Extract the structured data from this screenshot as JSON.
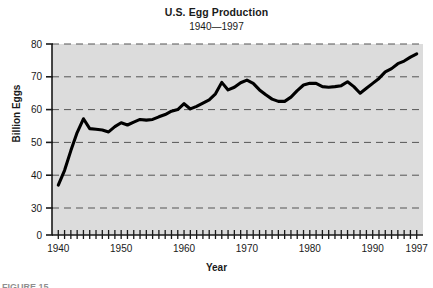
{
  "figure": {
    "title": "U.S. Egg Production",
    "subtitle": "1940—1997",
    "ylabel": "Billion Eggs",
    "xlabel": "Year",
    "caption_clipped": "FIGURE 15",
    "plot_bg_color": "#dcdcdc",
    "line_color": "#000000",
    "gridline_color": "#555555"
  },
  "chart_data": {
    "type": "line",
    "title": "U.S. Egg Production",
    "subtitle": "1940—1997",
    "xlabel": "Year",
    "ylabel": "Billion Eggs",
    "xlim": [
      1939,
      1998
    ],
    "ylim": [
      0,
      80
    ],
    "y_axis_broken": true,
    "y_axis_break_note": "axis jumps from 0 to 30",
    "grid": true,
    "grid_style": "dashed horizontal",
    "legend": null,
    "ytick_labels": [
      "0",
      "30",
      "40",
      "50",
      "60",
      "70",
      "80"
    ],
    "ytick_values": [
      0,
      30,
      40,
      50,
      60,
      70,
      80
    ],
    "xtick_labels": [
      "1940",
      "1950",
      "1960",
      "1970",
      "1980",
      "1990",
      "1997"
    ],
    "xtick_values": [
      1940,
      1950,
      1960,
      1970,
      1980,
      1990,
      1997
    ],
    "minor_xticks_every": 1,
    "series": [
      {
        "name": "U.S. Egg Production",
        "x": [
          1940,
          1941,
          1942,
          1943,
          1944,
          1945,
          1946,
          1947,
          1948,
          1949,
          1950,
          1951,
          1952,
          1953,
          1954,
          1955,
          1956,
          1957,
          1958,
          1959,
          1960,
          1961,
          1962,
          1963,
          1964,
          1965,
          1966,
          1967,
          1968,
          1969,
          1970,
          1971,
          1972,
          1973,
          1974,
          1975,
          1976,
          1977,
          1978,
          1979,
          1980,
          1981,
          1982,
          1983,
          1984,
          1985,
          1986,
          1987,
          1988,
          1989,
          1990,
          1991,
          1992,
          1993,
          1994,
          1995,
          1996,
          1997
        ],
        "values": [
          37.0,
          41.5,
          47.5,
          53.0,
          57.2,
          54.2,
          54.0,
          53.8,
          53.2,
          54.8,
          56.0,
          55.3,
          56.2,
          57.0,
          56.8,
          57.0,
          57.8,
          58.5,
          59.5,
          60.0,
          61.8,
          60.2,
          61.0,
          62.0,
          63.0,
          64.8,
          68.3,
          66.0,
          66.8,
          68.2,
          69.0,
          68.0,
          66.0,
          64.5,
          63.2,
          62.5,
          62.5,
          63.8,
          65.8,
          67.5,
          68.0,
          68.0,
          67.0,
          66.8,
          67.0,
          67.3,
          68.5,
          67.0,
          65.0,
          66.5,
          68.0,
          69.5,
          71.5,
          72.5,
          74.0,
          74.8,
          76.0,
          77.0
        ]
      }
    ]
  }
}
